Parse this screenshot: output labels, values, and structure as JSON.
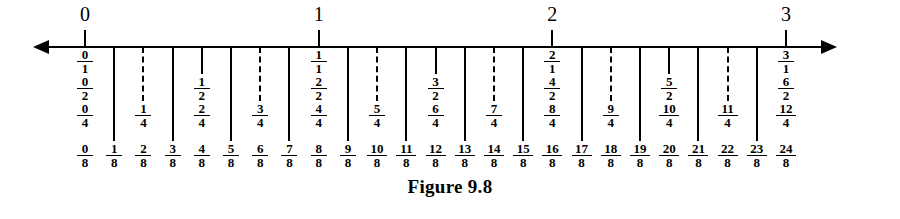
{
  "figure": {
    "caption": "Figure 9.8",
    "axis": {
      "type": "number-line",
      "left_arrow": "arrow-left-icon",
      "right_arrow": "arrow-right-icon",
      "unit_min": 0,
      "unit_max": 3,
      "subdivision": 8,
      "integer_labels": [
        "0",
        "1",
        "2",
        "3"
      ]
    }
  },
  "chart_data": {
    "type": "number-line",
    "title": "Figure 9.8",
    "xlabel": "",
    "ylabel": "",
    "xlim": [
      0,
      3
    ],
    "grid": false,
    "legend": "none",
    "tick_step": 0.125,
    "x": [
      0,
      0.125,
      0.25,
      0.375,
      0.5,
      0.625,
      0.75,
      0.875,
      1,
      1.125,
      1.25,
      1.375,
      1.5,
      1.625,
      1.75,
      1.875,
      2,
      2.125,
      2.25,
      2.375,
      2.5,
      2.625,
      2.75,
      2.875,
      3
    ],
    "ticks": [
      {
        "eighths": 0,
        "kind": "integer",
        "stroke": "solid-up",
        "top_label": "0",
        "labels": [
          {
            "num": "0",
            "den": "1"
          },
          {
            "num": "0",
            "den": "2"
          },
          {
            "num": "0",
            "den": "4"
          },
          {
            "num": "0",
            "den": "8"
          }
        ]
      },
      {
        "eighths": 1,
        "kind": "eighth",
        "stroke": "solid",
        "top_label": "",
        "labels": [
          {
            "num": "1",
            "den": "8"
          }
        ]
      },
      {
        "eighths": 2,
        "kind": "quarter",
        "stroke": "dashed",
        "top_label": "",
        "labels": [
          {
            "num": "1",
            "den": "4"
          },
          {
            "num": "2",
            "den": "8"
          }
        ]
      },
      {
        "eighths": 3,
        "kind": "eighth",
        "stroke": "solid",
        "top_label": "",
        "labels": [
          {
            "num": "3",
            "den": "8"
          }
        ]
      },
      {
        "eighths": 4,
        "kind": "half",
        "stroke": "solid",
        "top_label": "",
        "labels": [
          {
            "num": "1",
            "den": "2"
          },
          {
            "num": "2",
            "den": "4"
          },
          {
            "num": "4",
            "den": "8"
          }
        ]
      },
      {
        "eighths": 5,
        "kind": "eighth",
        "stroke": "solid",
        "top_label": "",
        "labels": [
          {
            "num": "5",
            "den": "8"
          }
        ]
      },
      {
        "eighths": 6,
        "kind": "quarter",
        "stroke": "dashed",
        "top_label": "",
        "labels": [
          {
            "num": "3",
            "den": "4"
          },
          {
            "num": "6",
            "den": "8"
          }
        ]
      },
      {
        "eighths": 7,
        "kind": "eighth",
        "stroke": "solid",
        "top_label": "",
        "labels": [
          {
            "num": "7",
            "den": "8"
          }
        ]
      },
      {
        "eighths": 8,
        "kind": "integer",
        "stroke": "solid-up",
        "top_label": "1",
        "labels": [
          {
            "num": "1",
            "den": "1"
          },
          {
            "num": "2",
            "den": "2"
          },
          {
            "num": "4",
            "den": "4"
          },
          {
            "num": "8",
            "den": "8"
          }
        ]
      },
      {
        "eighths": 9,
        "kind": "eighth",
        "stroke": "solid",
        "top_label": "",
        "labels": [
          {
            "num": "9",
            "den": "8"
          }
        ]
      },
      {
        "eighths": 10,
        "kind": "quarter",
        "stroke": "dashed",
        "top_label": "",
        "labels": [
          {
            "num": "5",
            "den": "4"
          },
          {
            "num": "10",
            "den": "8"
          }
        ]
      },
      {
        "eighths": 11,
        "kind": "eighth",
        "stroke": "solid",
        "top_label": "",
        "labels": [
          {
            "num": "11",
            "den": "8"
          }
        ]
      },
      {
        "eighths": 12,
        "kind": "half",
        "stroke": "solid",
        "top_label": "",
        "labels": [
          {
            "num": "3",
            "den": "2"
          },
          {
            "num": "6",
            "den": "4"
          },
          {
            "num": "12",
            "den": "8"
          }
        ]
      },
      {
        "eighths": 13,
        "kind": "eighth",
        "stroke": "solid",
        "top_label": "",
        "labels": [
          {
            "num": "13",
            "den": "8"
          }
        ]
      },
      {
        "eighths": 14,
        "kind": "quarter",
        "stroke": "dashed",
        "top_label": "",
        "labels": [
          {
            "num": "7",
            "den": "4"
          },
          {
            "num": "14",
            "den": "8"
          }
        ]
      },
      {
        "eighths": 15,
        "kind": "eighth",
        "stroke": "solid",
        "top_label": "",
        "labels": [
          {
            "num": "15",
            "den": "8"
          }
        ]
      },
      {
        "eighths": 16,
        "kind": "integer",
        "stroke": "solid-up",
        "top_label": "2",
        "labels": [
          {
            "num": "2",
            "den": "1"
          },
          {
            "num": "4",
            "den": "2"
          },
          {
            "num": "8",
            "den": "4"
          },
          {
            "num": "16",
            "den": "8"
          }
        ]
      },
      {
        "eighths": 17,
        "kind": "eighth",
        "stroke": "solid",
        "top_label": "",
        "labels": [
          {
            "num": "17",
            "den": "8"
          }
        ]
      },
      {
        "eighths": 18,
        "kind": "quarter",
        "stroke": "dashed",
        "top_label": "",
        "labels": [
          {
            "num": "9",
            "den": "4"
          },
          {
            "num": "18",
            "den": "8"
          }
        ]
      },
      {
        "eighths": 19,
        "kind": "eighth",
        "stroke": "solid",
        "top_label": "",
        "labels": [
          {
            "num": "19",
            "den": "8"
          }
        ]
      },
      {
        "eighths": 20,
        "kind": "half",
        "stroke": "solid",
        "top_label": "",
        "labels": [
          {
            "num": "5",
            "den": "2"
          },
          {
            "num": "10",
            "den": "4"
          },
          {
            "num": "20",
            "den": "8"
          }
        ]
      },
      {
        "eighths": 21,
        "kind": "eighth",
        "stroke": "solid",
        "top_label": "",
        "labels": [
          {
            "num": "21",
            "den": "8"
          }
        ]
      },
      {
        "eighths": 22,
        "kind": "quarter",
        "stroke": "dashed",
        "top_label": "",
        "labels": [
          {
            "num": "11",
            "den": "4"
          },
          {
            "num": "22",
            "den": "8"
          }
        ]
      },
      {
        "eighths": 23,
        "kind": "eighth",
        "stroke": "solid",
        "top_label": "",
        "labels": [
          {
            "num": "23",
            "den": "8"
          }
        ]
      },
      {
        "eighths": 24,
        "kind": "integer",
        "stroke": "solid-up",
        "top_label": "3",
        "labels": [
          {
            "num": "3",
            "den": "1"
          },
          {
            "num": "6",
            "den": "2"
          },
          {
            "num": "12",
            "den": "4"
          },
          {
            "num": "24",
            "den": "8"
          }
        ]
      }
    ]
  }
}
